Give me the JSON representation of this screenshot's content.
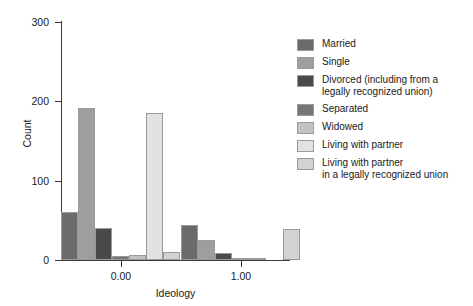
{
  "chart_data": {
    "type": "bar",
    "title": "",
    "xlabel": "Ideology",
    "ylabel": "Count",
    "categories": [
      "0.00",
      "1.00"
    ],
    "x": [
      0.0,
      1.0
    ],
    "xtick_labels": [
      "0.00",
      "1.00"
    ],
    "ytick_labels": [
      "0",
      "100",
      "200",
      "300"
    ],
    "ytick_values": [
      0,
      100,
      200,
      300
    ],
    "ylim": [
      0,
      300
    ],
    "xlim": [
      -0.42,
      1.48
    ],
    "grid": false,
    "legend_position": "right",
    "series": [
      {
        "name": "Married",
        "color": "#6b6b6b",
        "values": [
          60,
          44
        ]
      },
      {
        "name": "Single",
        "color": "#9e9e9e",
        "values": [
          192,
          25
        ]
      },
      {
        "name": "Divorced (including from a\nlegally recognized union)",
        "color": "#4a4a4a",
        "values": [
          40,
          9
        ]
      },
      {
        "name": "Separated",
        "color": "#767676",
        "values": [
          5,
          2
        ]
      },
      {
        "name": "Widowed",
        "color": "#c3c3c3",
        "values": [
          6,
          1
        ]
      },
      {
        "name": "Living with partner",
        "color": "#e2e2e2",
        "values": [
          185,
          0
        ]
      },
      {
        "name": "Living with partner\nin a legally recognized union",
        "color": "#d2d2d2",
        "values": [
          10,
          39
        ]
      }
    ]
  },
  "legend": {
    "items": [
      {
        "label": "Married"
      },
      {
        "label": "Single"
      },
      {
        "label": "Divorced (including from a\nlegally recognized union)"
      },
      {
        "label": "Separated"
      },
      {
        "label": "Widowed"
      },
      {
        "label": "Living with partner"
      },
      {
        "label": "Living with partner\nin a legally recognized union"
      }
    ]
  }
}
